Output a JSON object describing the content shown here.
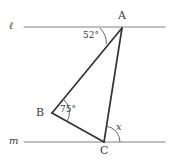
{
  "figure": {
    "background_color": "#ffffff",
    "line_color": "#808080",
    "triangle_color": "#333333",
    "text_color": "#3a3a3a",
    "width": 171,
    "height": 164
  },
  "lines": [
    {
      "name": "line-ell",
      "label": "ℓ",
      "label_x": 9,
      "label_y": 21,
      "x1": 24,
      "y1": 27,
      "x2": 165,
      "y2": 27
    },
    {
      "name": "line-m",
      "label": "m",
      "label_x": 9,
      "label_y": 136,
      "x1": 24,
      "y1": 142,
      "x2": 165,
      "y2": 142
    }
  ],
  "points": [
    {
      "name": "A",
      "label": "A",
      "x": 122,
      "y": 28,
      "label_x": 118,
      "label_y": 10
    },
    {
      "name": "B",
      "label": "B",
      "x": 52,
      "y": 113,
      "label_x": 36,
      "label_y": 107
    },
    {
      "name": "C",
      "label": "C",
      "x": 104,
      "y": 142,
      "label_x": 100,
      "label_y": 145
    }
  ],
  "triangle": {
    "name": "triangle-ABC",
    "vertices": "122,28 52,113 104,142",
    "sides": [
      {
        "name": "side-AB",
        "x1": 122,
        "y1": 28,
        "x2": 52,
        "y2": 113
      },
      {
        "name": "side-BC",
        "x1": 52,
        "y1": 113,
        "x2": 104,
        "y2": 142
      },
      {
        "name": "side-CA",
        "x1": 104,
        "y1": 142,
        "x2": 122,
        "y2": 28
      }
    ]
  },
  "angles": [
    {
      "name": "angle-at-A",
      "label": "52°",
      "value": 52,
      "vertex": "A",
      "arc_path": "M 100 28 A 22 22 0 0 1 106.4 43.9",
      "label_x": 83,
      "label_y": 31,
      "italic": false
    },
    {
      "name": "angle-at-B",
      "label": "75°",
      "value": 75,
      "vertex": "B",
      "arc_path": "M 63.5 99.3 A 17.5 17.5 0 0 1 66.8 121.8",
      "label_x": 60,
      "label_y": 105,
      "italic": false
    },
    {
      "name": "angle-at-C",
      "label": "x",
      "value": null,
      "vertex": "C",
      "arc_path": "M 120 142 A 16 16 0 0 0 106.5 126.2",
      "label_x": 116,
      "label_y": 122,
      "italic": true
    }
  ]
}
